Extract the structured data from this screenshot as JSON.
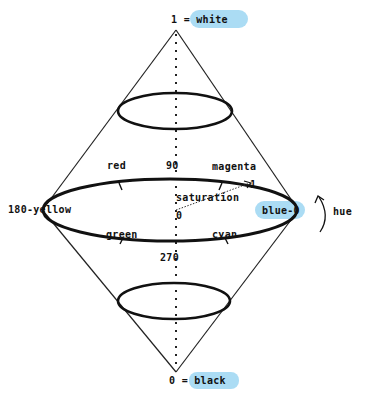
{
  "diagram": {
    "labels": {
      "top": "1 = white",
      "bottom": "0 = black",
      "hue_0": "blue-0",
      "hue_90": "90",
      "hue_180": "180-yellow",
      "hue_270": "270",
      "red": "red",
      "magenta": "magenta",
      "green": "green",
      "cyan": "cyan",
      "saturation": "saturation",
      "saturation_zero": "0",
      "saturation_one": "1",
      "hue": "hue"
    },
    "colors": {
      "line": "#111111",
      "highlight": "#8fd0f0",
      "background": "#ffffff"
    }
  }
}
